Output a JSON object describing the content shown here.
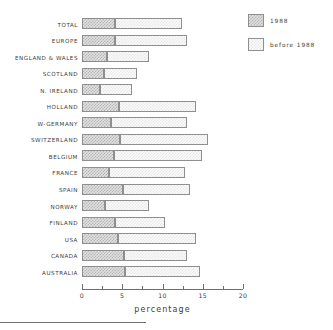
{
  "chart_data": {
    "type": "bar",
    "orientation": "horizontal",
    "stacked": true,
    "title": "",
    "xlabel": "percentage",
    "ylabel": "",
    "xlim": [
      0,
      20
    ],
    "xticks": [
      0,
      5,
      10,
      15,
      20
    ],
    "xtick_labels": [
      "0",
      "5",
      "10",
      "15",
      "20"
    ],
    "minor_ticks": [
      2.5,
      7.5,
      12.5,
      17.5
    ],
    "grid": false,
    "legend_position": "top-right",
    "categories": [
      "TOTAL",
      "EUROPE",
      "ENGLAND & WALES",
      "SCOTLAND",
      "N. IRELAND",
      "HOLLAND",
      "W-GERMANY",
      "SWITZERLAND",
      "BELGIUM",
      "FRANCE",
      "SPAIN",
      "NORWAY",
      "FINLAND",
      "USA",
      "CANADA",
      "AUSTRALIA"
    ],
    "series": [
      {
        "name": "1988",
        "values": [
          4.1,
          4.1,
          3.1,
          2.7,
          2.2,
          4.6,
          3.6,
          4.7,
          4.0,
          3.4,
          5.1,
          2.9,
          4.1,
          4.5,
          5.2,
          5.3
        ]
      },
      {
        "name": "before 1988",
        "values": [
          8.3,
          8.9,
          5.2,
          4.1,
          4.0,
          9.6,
          9.5,
          11.0,
          10.9,
          9.4,
          8.3,
          5.4,
          6.2,
          9.7,
          7.8,
          9.3
        ]
      }
    ],
    "totals": [
      12.4,
      13.0,
      8.3,
      6.8,
      6.2,
      14.2,
      13.1,
      15.7,
      14.9,
      12.8,
      13.4,
      8.3,
      10.3,
      14.2,
      13.0,
      14.6
    ]
  },
  "legend": {
    "items": [
      {
        "label": "1988",
        "swatch": "hatched-dark"
      },
      {
        "label": "before 1988",
        "swatch": "hatched-light"
      }
    ]
  }
}
